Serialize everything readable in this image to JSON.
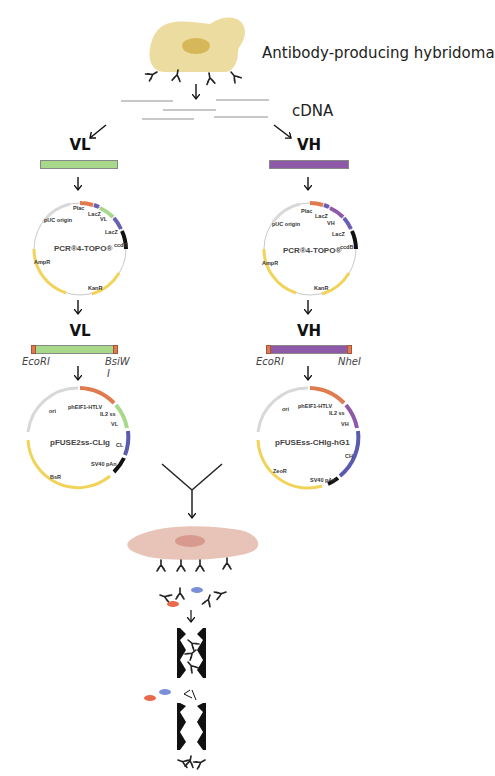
{
  "hybridoma": {
    "label": "Antibody-producing hybridoma",
    "cell_color": "#eddca0",
    "nucleus_color": "#d6b85a"
  },
  "cdna": {
    "label": "cDNA"
  },
  "light_chain": {
    "label": "VL",
    "bar_color": "#a8d88a",
    "cloning_vector": {
      "name": "PCR®4-TOPO®",
      "features": [
        "Plac",
        "LacZ",
        "VL",
        "LacZ",
        "ccdB",
        "KanR",
        "AmpR",
        "pUC origin"
      ]
    },
    "insert_label": "VL",
    "sites": {
      "left": "EcoRI",
      "right_line1": "BsiW",
      "right_line2": "I"
    },
    "expression_vector": {
      "name": "pFUSE2ss-CLIg",
      "features": [
        "phEIF1-HTLV",
        "IL2 ss",
        "VL",
        "CL",
        "SV40 pAn",
        "BsR",
        "ori"
      ]
    }
  },
  "heavy_chain": {
    "label": "VH",
    "bar_color": "#8e5aa8",
    "cloning_vector": {
      "name": "PCR®4-TOPO®",
      "features": [
        "Plac",
        "LacZ",
        "VH",
        "LacZ",
        "ccdB",
        "KanR",
        "AmpR",
        "pUC origin"
      ]
    },
    "insert_label": "VH",
    "sites": {
      "left": "EcoRI",
      "right": "NheI"
    },
    "expression_vector": {
      "name": "pFUSEss-CHIg-hG1",
      "features": [
        "phEIF1-HTLV",
        "IL2 ss",
        "VH",
        "CH",
        "SV40 pAn",
        "ZeoR",
        "ori"
      ]
    }
  },
  "producer_cell": {
    "cell_color": "#e8c4b8",
    "nucleus_color": "#d89a8e"
  },
  "colors": {
    "promoter": "#e07a4f",
    "lacz": "#6a5fb5",
    "ccdb": "#111111",
    "resistance": "#f2d35a",
    "origin": "#d8d8d8",
    "constant": "#5a5ab0",
    "impurity_red": "#e86a4a",
    "impurity_blue": "#7a8fd8"
  }
}
